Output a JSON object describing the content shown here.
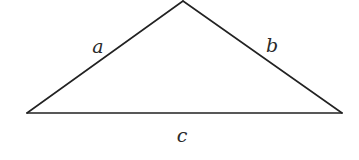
{
  "diagram": {
    "type": "triangle",
    "vertices": {
      "top": [
        183,
        1
      ],
      "left": [
        27,
        113
      ],
      "right": [
        342,
        113
      ]
    },
    "sides": [
      {
        "name": "a",
        "label": "a",
        "from": "left",
        "to": "top",
        "label_pos": [
          98,
          53
        ]
      },
      {
        "name": "b",
        "label": "b",
        "from": "top",
        "to": "right",
        "label_pos": [
          272,
          52
        ]
      },
      {
        "name": "c",
        "label": "c",
        "from": "left",
        "to": "right",
        "label_pos": [
          182,
          142
        ]
      }
    ],
    "stroke_color": "#222222",
    "label_color": "#2a2a2a"
  }
}
